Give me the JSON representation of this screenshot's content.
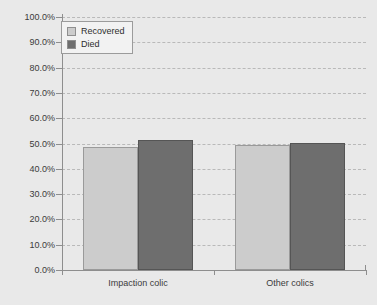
{
  "chart_data": {
    "type": "bar",
    "title": "",
    "xlabel": "",
    "ylabel": "",
    "categories": [
      "Impaction colic",
      "Other colics"
    ],
    "series": [
      {
        "name": "Recovered",
        "color": "#cccccc",
        "values": [
          48.5,
          49.3
        ]
      },
      {
        "name": "Died",
        "color": "#6e6e6e",
        "values": [
          51.5,
          50.3
        ]
      }
    ],
    "ylim": [
      0,
      100
    ],
    "ytick_values": [
      0,
      10,
      20,
      30,
      40,
      50,
      60,
      70,
      80,
      90,
      100
    ],
    "ytick_labels": [
      "0.0%",
      "10.0%",
      "20.0%",
      "30.0%",
      "40.0%",
      "50.0%",
      "60.0%",
      "70.0%",
      "80.0%",
      "90.0%",
      "100.0%"
    ],
    "grid": true,
    "grid_style": "dashed",
    "legend_position": "top-left-inside",
    "background_color": "#e9e9e9",
    "axis_color": "#8e8e8e"
  },
  "legend": {
    "entries": [
      {
        "label": "Recovered"
      },
      {
        "label": "Died"
      }
    ]
  },
  "axis": {
    "y_labels": [
      "100.0%",
      "90.0%",
      "80.0%",
      "70.0%",
      "60.0%",
      "50.0%",
      "40.0%",
      "30.0%",
      "20.0%",
      "10.0%",
      "0.0%"
    ],
    "x_labels": [
      "Impaction colic",
      "Other colics"
    ]
  },
  "watermark": {
    "text": ""
  }
}
